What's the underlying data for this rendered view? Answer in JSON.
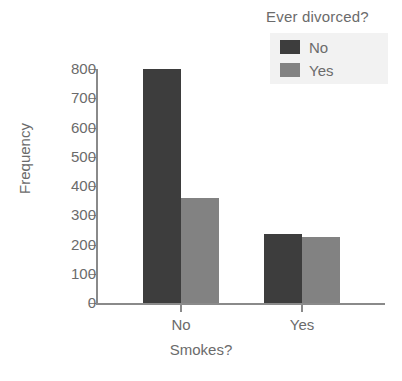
{
  "chart_data": {
    "type": "bar",
    "title": "",
    "xlabel": "Smokes?",
    "ylabel": "Frequency",
    "categories": [
      "No",
      "Yes"
    ],
    "series": [
      {
        "name": "No",
        "color": "#3d3d3d",
        "values": [
          800,
          235
        ]
      },
      {
        "name": "Yes",
        "color": "#828282",
        "values": [
          360,
          225
        ]
      }
    ],
    "ylim": [
      0,
      800
    ],
    "yticks": [
      0,
      100,
      200,
      300,
      400,
      500,
      600,
      700,
      800
    ],
    "ytick_labels": [
      "0",
      "100",
      "200",
      "300",
      "400",
      "500",
      "600",
      "700",
      "800"
    ],
    "grid": false,
    "legend": {
      "title": "Ever divorced?",
      "position": "top-right",
      "entries": [
        {
          "label": "No",
          "color": "#3d3d3d"
        },
        {
          "label": "Yes",
          "color": "#828282"
        }
      ]
    }
  },
  "colors": {
    "series_no": "#3d3d3d",
    "series_yes": "#828282",
    "axis": "#8a8a8a",
    "text": "#6b6b6b",
    "legend_panel": "#f2f2f2",
    "background": "#ffffff"
  }
}
